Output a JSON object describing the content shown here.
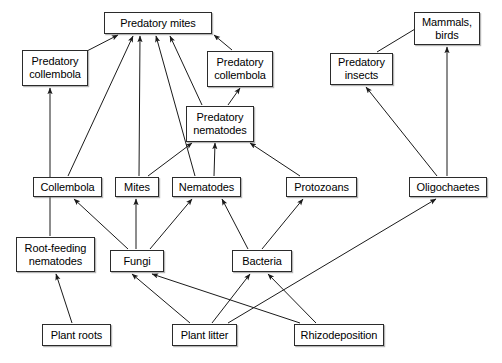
{
  "diagram": {
    "type": "food-web-diagram",
    "background_color": "#ffffff",
    "box_border_color": "#2b2b2b",
    "arrow_color": "#1a1a1a",
    "nodes": [
      {
        "id": "predatory-mites",
        "label": "Predatory mites",
        "x": 104,
        "y": 12,
        "w": 108,
        "h": 22
      },
      {
        "id": "predatory-collembola-left",
        "label": "Predatory\ncollembola",
        "x": 22,
        "y": 50,
        "w": 66,
        "h": 36
      },
      {
        "id": "predatory-collembola-right",
        "label": "Predatory\ncollembola",
        "x": 207,
        "y": 51,
        "w": 66,
        "h": 36
      },
      {
        "id": "predatory-nematodes",
        "label": "Predatory\nnematodes",
        "x": 186,
        "y": 106,
        "w": 68,
        "h": 36
      },
      {
        "id": "predatory-insects",
        "label": "Predatory\ninsects",
        "x": 330,
        "y": 53,
        "w": 63,
        "h": 32
      },
      {
        "id": "mammals-birds",
        "label": "Mammals,\nbirds",
        "x": 414,
        "y": 12,
        "w": 66,
        "h": 33
      },
      {
        "id": "collembola",
        "label": "Collembola",
        "x": 33,
        "y": 177,
        "w": 69,
        "h": 20
      },
      {
        "id": "mites",
        "label": "Mites",
        "x": 115,
        "y": 177,
        "w": 44,
        "h": 20
      },
      {
        "id": "nematodes",
        "label": "Nematodes",
        "x": 172,
        "y": 177,
        "w": 69,
        "h": 20
      },
      {
        "id": "protozoans",
        "label": "Protozoans",
        "x": 286,
        "y": 177,
        "w": 71,
        "h": 20
      },
      {
        "id": "oligochaetes",
        "label": "Oligochaetes",
        "x": 409,
        "y": 177,
        "w": 78,
        "h": 20
      },
      {
        "id": "root-feeding-nematodes",
        "label": "Root-feeding\nnematodes",
        "x": 16,
        "y": 237,
        "w": 79,
        "h": 35
      },
      {
        "id": "fungi",
        "label": "Fungi",
        "x": 110,
        "y": 250,
        "w": 54,
        "h": 22
      },
      {
        "id": "bacteria",
        "label": "Bacteria",
        "x": 232,
        "y": 250,
        "w": 60,
        "h": 22
      },
      {
        "id": "plant-roots",
        "label": "Plant roots",
        "x": 42,
        "y": 324,
        "w": 69,
        "h": 22
      },
      {
        "id": "plant-litter",
        "label": "Plant litter",
        "x": 172,
        "y": 324,
        "w": 65,
        "h": 22
      },
      {
        "id": "rhizodeposition",
        "label": "Rhizodeposition",
        "x": 294,
        "y": 324,
        "w": 90,
        "h": 22
      }
    ],
    "edges": [
      {
        "id": "e1",
        "from": "predatory-collembola-left",
        "to": "predatory-mites",
        "x1": 85,
        "y1": 52,
        "x2": 118,
        "y2": 35
      },
      {
        "id": "e2",
        "from": "collembola",
        "to": "predatory-mites",
        "x1": 68,
        "y1": 176,
        "x2": 133,
        "y2": 36
      },
      {
        "id": "e3",
        "from": "mites",
        "to": "predatory-mites",
        "x1": 139,
        "y1": 176,
        "x2": 140,
        "y2": 36
      },
      {
        "id": "e4",
        "from": "nematodes",
        "to": "predatory-mites",
        "x1": 195,
        "y1": 176,
        "x2": 156,
        "y2": 36
      },
      {
        "id": "e5",
        "from": "predatory-nematodes",
        "to": "predatory-mites",
        "x1": 202,
        "y1": 105,
        "x2": 170,
        "y2": 36
      },
      {
        "id": "e6",
        "from": "predatory-collembola-right",
        "to": "predatory-mites",
        "x1": 232,
        "y1": 50,
        "x2": 214,
        "y2": 35
      },
      {
        "id": "e7",
        "from": "predatory-nematodes",
        "to": "predatory-collembola-right",
        "x1": 228,
        "y1": 105,
        "x2": 240,
        "y2": 88
      },
      {
        "id": "e8",
        "from": "collembola",
        "to": "predatory-nematodes",
        "x1": 148,
        "y1": 176,
        "x2": 192,
        "y2": 143
      },
      {
        "id": "e9",
        "from": "nematodes",
        "to": "predatory-nematodes",
        "x1": 214,
        "y1": 176,
        "x2": 215,
        "y2": 143
      },
      {
        "id": "e10",
        "from": "protozoans",
        "to": "predatory-nematodes",
        "x1": 300,
        "y1": 176,
        "x2": 250,
        "y2": 143
      },
      {
        "id": "e11",
        "from": "root-feeding-nematodes",
        "to": "predatory-collembola-left",
        "x1": 50,
        "y1": 236,
        "x2": 50,
        "y2": 88
      },
      {
        "id": "e12",
        "from": "fungi",
        "to": "collembola",
        "x1": 128,
        "y1": 249,
        "x2": 74,
        "y2": 199
      },
      {
        "id": "e13",
        "from": "fungi",
        "to": "mites",
        "x1": 136,
        "y1": 249,
        "x2": 136,
        "y2": 199
      },
      {
        "id": "e14",
        "from": "fungi",
        "to": "nematodes",
        "x1": 150,
        "y1": 249,
        "x2": 192,
        "y2": 199
      },
      {
        "id": "e15",
        "from": "bacteria",
        "to": "nematodes",
        "x1": 248,
        "y1": 249,
        "x2": 222,
        "y2": 199
      },
      {
        "id": "e16",
        "from": "bacteria",
        "to": "protozoans",
        "x1": 262,
        "y1": 249,
        "x2": 303,
        "y2": 199
      },
      {
        "id": "e17",
        "from": "plant-roots",
        "to": "root-feeding-nematodes",
        "x1": 72,
        "y1": 323,
        "x2": 56,
        "y2": 274
      },
      {
        "id": "e18",
        "from": "plant-litter",
        "to": "fungi",
        "x1": 190,
        "y1": 323,
        "x2": 132,
        "y2": 274
      },
      {
        "id": "e19",
        "from": "rhizodeposition",
        "to": "fungi",
        "x1": 300,
        "y1": 323,
        "x2": 152,
        "y2": 274
      },
      {
        "id": "e20",
        "from": "plant-litter",
        "to": "bacteria",
        "x1": 212,
        "y1": 323,
        "x2": 250,
        "y2": 274
      },
      {
        "id": "e21",
        "from": "rhizodeposition",
        "to": "bacteria",
        "x1": 316,
        "y1": 323,
        "x2": 268,
        "y2": 274
      },
      {
        "id": "e22",
        "from": "plant-litter",
        "to": "oligochaetes",
        "x1": 228,
        "y1": 323,
        "x2": 436,
        "y2": 199
      },
      {
        "id": "e23",
        "from": "oligochaetes",
        "to": "predatory-insects",
        "x1": 437,
        "y1": 176,
        "x2": 366,
        "y2": 87
      },
      {
        "id": "e24",
        "from": "oligochaetes",
        "to": "mammals-birds",
        "x1": 447,
        "y1": 176,
        "x2": 447,
        "y2": 47
      },
      {
        "id": "e25",
        "from": "predatory-insects",
        "to": "mammals-birds",
        "x1": 377,
        "y1": 52,
        "x2": 420,
        "y2": 26
      }
    ]
  }
}
